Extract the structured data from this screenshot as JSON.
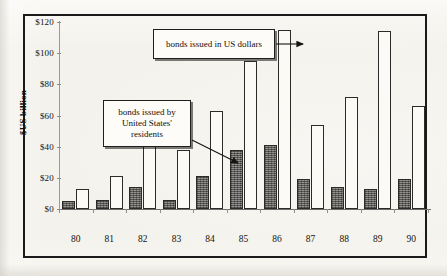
{
  "chart_data": {
    "type": "bar",
    "title": "",
    "subtitle": "",
    "xlabel": "",
    "ylabel": "$US billion",
    "ylim": [
      0,
      120
    ],
    "ytick_labels": [
      "$0",
      "$20",
      "$40",
      "$60",
      "$80",
      "$100",
      "$120"
    ],
    "ytick_values": [
      0,
      20,
      40,
      60,
      80,
      100,
      120
    ],
    "categories": [
      "80",
      "81",
      "82",
      "83",
      "84",
      "85",
      "86",
      "87",
      "88",
      "89",
      "90"
    ],
    "grid": false,
    "legend_position": "none",
    "series": [
      {
        "name": "bonds issued by United States' residents",
        "style": "shaded",
        "values": [
          5,
          6,
          14,
          6,
          21,
          38,
          41,
          19,
          14,
          13,
          19
        ]
      },
      {
        "name": "bonds issued in US dollars",
        "style": "open",
        "values": [
          13,
          21,
          41,
          38,
          63,
          95,
          115,
          54,
          72,
          114,
          66
        ]
      }
    ],
    "annotations": [
      {
        "id": "callout-dollars",
        "lines": [
          "bonds issued in US dollars"
        ],
        "points_to": "86-open-bar"
      },
      {
        "id": "callout-residents",
        "lines": [
          "bonds issued by",
          "United States'",
          "residents"
        ],
        "points_to": "85-shaded-bar"
      }
    ]
  },
  "colors": {
    "shaded_bar": "#6f6e6a",
    "open_bar": "#fbfaf6",
    "bar_outline": "#2b2b29",
    "frame": "#1a1a1a",
    "axis": "#8e8e8a",
    "text": "#15130f",
    "paper": "#f4f2ec"
  }
}
